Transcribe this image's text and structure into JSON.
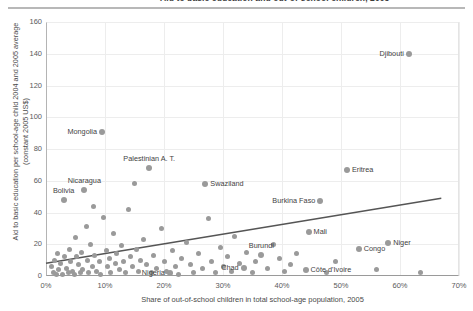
{
  "header": {
    "title": "Aid to basic education and out-of-school children, 2005"
  },
  "chart_data": {
    "type": "scatter",
    "title": "Aid to basic education and out-of-school children, 2005",
    "xlabel": "Share of out-of-school children in total school-age population, 2005",
    "ylabel": "Aid to basic education per school-age child 2004 and 2005 average (constant 2005 US$)",
    "xlim": [
      0,
      70
    ],
    "ylim": [
      0,
      160
    ],
    "xticks": [
      "0%",
      "10%",
      "20%",
      "30%",
      "40%",
      "50%",
      "60%",
      "70%"
    ],
    "xtick_values": [
      0,
      10,
      20,
      30,
      40,
      50,
      60,
      70
    ],
    "yticks": [
      "0",
      "20",
      "40",
      "60",
      "80",
      "100",
      "120",
      "140",
      "160"
    ],
    "ytick_values": [
      0,
      20,
      40,
      60,
      80,
      100,
      120,
      140,
      160
    ],
    "grid": true,
    "legend": "none",
    "marker_color": "#9a9a9a",
    "trendline": {
      "label": "linear trend",
      "color": "#555555",
      "x_start": 0,
      "y_start": 8,
      "x_end": 67,
      "y_end": 49
    },
    "labeled_points": [
      {
        "name": "Djibouti",
        "x": 61.5,
        "y": 140,
        "label_pos": "left"
      },
      {
        "name": "Eritrea",
        "x": 51.0,
        "y": 67,
        "label_pos": "right"
      },
      {
        "name": "Mongolia",
        "x": 9.5,
        "y": 91,
        "label_pos": "left"
      },
      {
        "name": "Palestinian A. T.",
        "x": 17.5,
        "y": 68,
        "label_pos": "above"
      },
      {
        "name": "Swaziland",
        "x": 27.0,
        "y": 58,
        "label_pos": "right"
      },
      {
        "name": "Nicaragua",
        "x": 6.5,
        "y": 54,
        "label_pos": "above"
      },
      {
        "name": "Bolivia",
        "x": 3.0,
        "y": 48,
        "label_pos": "above"
      },
      {
        "name": "Burkina Faso",
        "x": 46.5,
        "y": 47,
        "label_pos": "left"
      },
      {
        "name": "Mali",
        "x": 44.5,
        "y": 28,
        "label_pos": "right"
      },
      {
        "name": "Niger",
        "x": 58.0,
        "y": 21,
        "label_pos": "right"
      },
      {
        "name": "Congo",
        "x": 53.0,
        "y": 17,
        "label_pos": "right"
      },
      {
        "name": "Burundi",
        "x": 36.5,
        "y": 13,
        "label_pos": "above"
      },
      {
        "name": "Chad",
        "x": 33.5,
        "y": 5,
        "label_pos": "left"
      },
      {
        "name": "Côte d'Ivoire",
        "x": 44.0,
        "y": 4,
        "label_pos": "right"
      },
      {
        "name": "Nigeria",
        "x": 21.0,
        "y": 2,
        "label_pos": "left"
      }
    ],
    "unlabeled_points": [
      {
        "x": 1.0,
        "y": 6
      },
      {
        "x": 1.2,
        "y": 2
      },
      {
        "x": 1.5,
        "y": 10
      },
      {
        "x": 1.8,
        "y": 1
      },
      {
        "x": 2.0,
        "y": 14
      },
      {
        "x": 2.2,
        "y": 4
      },
      {
        "x": 2.5,
        "y": 8
      },
      {
        "x": 2.8,
        "y": 1
      },
      {
        "x": 3.2,
        "y": 12
      },
      {
        "x": 3.5,
        "y": 5
      },
      {
        "x": 3.8,
        "y": 2
      },
      {
        "x": 4.0,
        "y": 17
      },
      {
        "x": 4.2,
        "y": 9
      },
      {
        "x": 4.5,
        "y": 3
      },
      {
        "x": 4.8,
        "y": 1
      },
      {
        "x": 5.0,
        "y": 24
      },
      {
        "x": 5.2,
        "y": 12
      },
      {
        "x": 5.5,
        "y": 7
      },
      {
        "x": 5.8,
        "y": 2
      },
      {
        "x": 6.0,
        "y": 15
      },
      {
        "x": 6.2,
        "y": 4
      },
      {
        "x": 6.8,
        "y": 31
      },
      {
        "x": 7.0,
        "y": 10
      },
      {
        "x": 7.2,
        "y": 2
      },
      {
        "x": 7.5,
        "y": 20
      },
      {
        "x": 7.8,
        "y": 6
      },
      {
        "x": 8.0,
        "y": 44
      },
      {
        "x": 8.3,
        "y": 13
      },
      {
        "x": 8.6,
        "y": 3
      },
      {
        "x": 9.0,
        "y": 9
      },
      {
        "x": 9.3,
        "y": 1
      },
      {
        "x": 9.8,
        "y": 37
      },
      {
        "x": 10.2,
        "y": 16
      },
      {
        "x": 10.5,
        "y": 6
      },
      {
        "x": 10.8,
        "y": 11
      },
      {
        "x": 11.0,
        "y": 2
      },
      {
        "x": 11.5,
        "y": 27
      },
      {
        "x": 11.8,
        "y": 8
      },
      {
        "x": 12.0,
        "y": 14
      },
      {
        "x": 12.5,
        "y": 4
      },
      {
        "x": 12.8,
        "y": 19
      },
      {
        "x": 13.2,
        "y": 9
      },
      {
        "x": 13.5,
        "y": 2
      },
      {
        "x": 14.0,
        "y": 42
      },
      {
        "x": 14.3,
        "y": 12
      },
      {
        "x": 14.6,
        "y": 6
      },
      {
        "x": 15.0,
        "y": 58
      },
      {
        "x": 15.3,
        "y": 17
      },
      {
        "x": 15.6,
        "y": 3
      },
      {
        "x": 16.0,
        "y": 10
      },
      {
        "x": 16.5,
        "y": 23
      },
      {
        "x": 17.0,
        "y": 7
      },
      {
        "x": 17.8,
        "y": 2
      },
      {
        "x": 18.2,
        "y": 13
      },
      {
        "x": 18.8,
        "y": 5
      },
      {
        "x": 19.5,
        "y": 30
      },
      {
        "x": 20.0,
        "y": 9
      },
      {
        "x": 20.5,
        "y": 3
      },
      {
        "x": 21.5,
        "y": 16
      },
      {
        "x": 22.0,
        "y": 6
      },
      {
        "x": 22.5,
        "y": 1
      },
      {
        "x": 23.0,
        "y": 11
      },
      {
        "x": 23.8,
        "y": 21
      },
      {
        "x": 24.5,
        "y": 7
      },
      {
        "x": 25.0,
        "y": 2
      },
      {
        "x": 25.8,
        "y": 14
      },
      {
        "x": 26.5,
        "y": 5
      },
      {
        "x": 27.5,
        "y": 36
      },
      {
        "x": 28.0,
        "y": 9
      },
      {
        "x": 28.8,
        "y": 2
      },
      {
        "x": 29.5,
        "y": 18
      },
      {
        "x": 30.0,
        "y": 6
      },
      {
        "x": 30.8,
        "y": 12
      },
      {
        "x": 31.5,
        "y": 3
      },
      {
        "x": 32.0,
        "y": 25
      },
      {
        "x": 32.8,
        "y": 8
      },
      {
        "x": 34.0,
        "y": 15
      },
      {
        "x": 35.0,
        "y": 2
      },
      {
        "x": 35.5,
        "y": 9
      },
      {
        "x": 37.5,
        "y": 5
      },
      {
        "x": 38.5,
        "y": 20
      },
      {
        "x": 39.5,
        "y": 11
      },
      {
        "x": 40.5,
        "y": 3
      },
      {
        "x": 41.5,
        "y": 7
      },
      {
        "x": 42.5,
        "y": 14
      },
      {
        "x": 47.5,
        "y": 2
      },
      {
        "x": 49.0,
        "y": 9
      },
      {
        "x": 56.0,
        "y": 4
      },
      {
        "x": 63.5,
        "y": 2
      }
    ]
  }
}
